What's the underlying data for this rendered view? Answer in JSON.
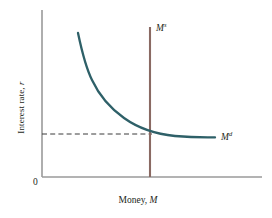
{
  "chart_data": {
    "type": "line",
    "title": "",
    "xlabel": "Money, M",
    "ylabel": "Interest rate, r",
    "origin_label": "0",
    "grid": false,
    "legend": "inline-curve-labels",
    "axis_color": "#9a9a9a",
    "series": [
      {
        "name": "Money demand",
        "label_base": "M",
        "label_sup": "d",
        "color": "#2e6068",
        "shape": "downward-sloping convex curve",
        "points": [
          [
            78,
            33
          ],
          [
            84,
            55
          ],
          [
            90,
            72
          ],
          [
            97,
            87
          ],
          [
            106,
            100
          ],
          [
            117,
            111
          ],
          [
            130,
            121
          ],
          [
            143,
            128
          ],
          [
            155,
            133
          ],
          [
            170,
            136
          ],
          [
            190,
            137
          ],
          [
            215,
            137
          ]
        ]
      },
      {
        "name": "Money supply",
        "label_base": "M",
        "label_sup": "s",
        "color": "#8a6a63",
        "shape": "vertical line",
        "x": 150,
        "y_top": 27,
        "y_bottom": 177
      }
    ],
    "annotations": [
      {
        "name": "equilibrium-dashed-line",
        "style": "dashed",
        "color": "#333333",
        "from": [
          42,
          134
        ],
        "to": [
          152,
          134
        ]
      }
    ],
    "axes": {
      "y_axis": {
        "x": 42,
        "y_top": 10,
        "y_bottom": 177
      },
      "x_axis": {
        "y": 177,
        "x_left": 42,
        "x_right": 262
      }
    }
  },
  "labels": {
    "y_axis_title": "Interest rate, r",
    "x_axis_title": "Money, M",
    "origin": "0",
    "supply_base": "M",
    "supply_sup": "s",
    "demand_base": "M",
    "demand_sup": "d"
  }
}
